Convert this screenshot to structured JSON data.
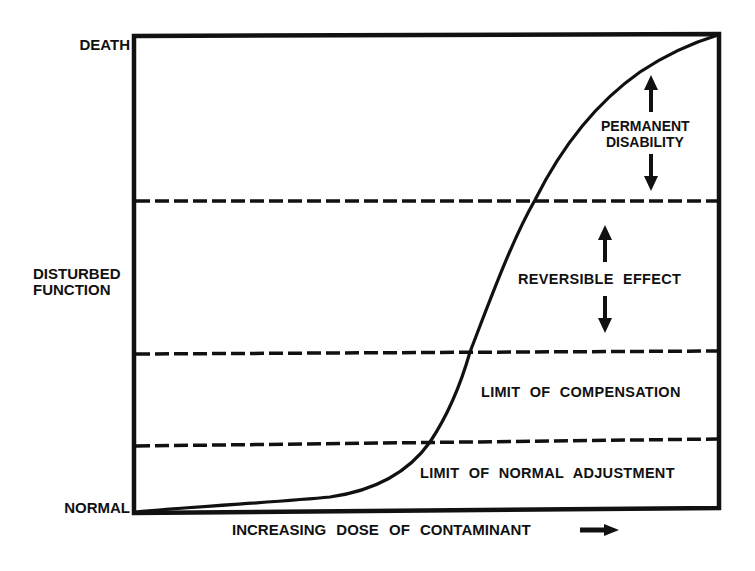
{
  "diagram": {
    "type": "dose-response curve",
    "y_axis": {
      "labels": [
        {
          "text": "DEATH",
          "position": "top"
        },
        {
          "text": "DISTURBED",
          "position": "middle",
          "line": 1
        },
        {
          "text": "FUNCTION",
          "position": "middle",
          "line": 2
        },
        {
          "text": "NORMAL",
          "position": "bottom"
        }
      ],
      "top_label": "DEATH",
      "middle_label_line1": "DISTURBED",
      "middle_label_line2": "FUNCTION",
      "bottom_label": "NORMAL"
    },
    "x_axis": {
      "label": "INCREASING DOSE OF CONTAMINANT",
      "arrow": "right-arrow-icon"
    },
    "zones": {
      "permanent_line1": "PERMANENT",
      "permanent_line2": "DISABILITY",
      "reversible": "REVERSIBLE EFFECT",
      "compensation": "LIMIT OF COMPENSATION",
      "normal_adjustment": "LIMIT OF NORMAL ADJUSTMENT"
    },
    "threshold_lines": [
      {
        "name": "permanent-disability-threshold",
        "style": "dashed"
      },
      {
        "name": "limit-of-compensation-threshold",
        "style": "dashed"
      },
      {
        "name": "limit-of-normal-adjustment-threshold",
        "style": "dashed"
      }
    ],
    "curve": {
      "shape": "sigmoid",
      "from": "NORMAL",
      "to": "DEATH"
    },
    "colors": {
      "ink": "#111111",
      "background": "#ffffff"
    }
  }
}
